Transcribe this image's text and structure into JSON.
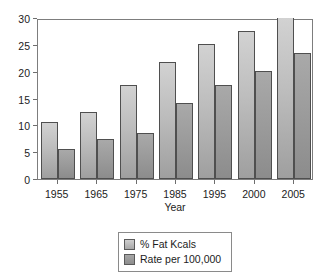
{
  "chart_data": {
    "type": "bar",
    "title": "",
    "subtitle": "",
    "xlabel": "Year",
    "ylabel": "",
    "categories": [
      "1955",
      "1965",
      "1975",
      "1985",
      "1995",
      "2000",
      "2005"
    ],
    "series": [
      {
        "name": "% Fat Kcals",
        "color": "#bdbdbd",
        "values": [
          10.7,
          12.5,
          17.5,
          21.8,
          25.1,
          27.6,
          30.0
        ]
      },
      {
        "name": "Rate per 100,000",
        "color": "#9b9b9b",
        "values": [
          5.6,
          7.5,
          8.5,
          14.2,
          17.6,
          20.1,
          23.4
        ]
      }
    ],
    "ylim": [
      0,
      30
    ],
    "ytick_values": [
      0,
      5,
      10,
      15,
      20,
      25,
      30
    ],
    "ytick_labels": [
      "0",
      "5",
      "10",
      "15",
      "20",
      "25",
      "30"
    ],
    "grid": false,
    "legend_position": "bottom"
  },
  "legend": {
    "entries": [
      {
        "label": "% Fat Kcals"
      },
      {
        "label": "Rate per 100,000"
      }
    ]
  }
}
